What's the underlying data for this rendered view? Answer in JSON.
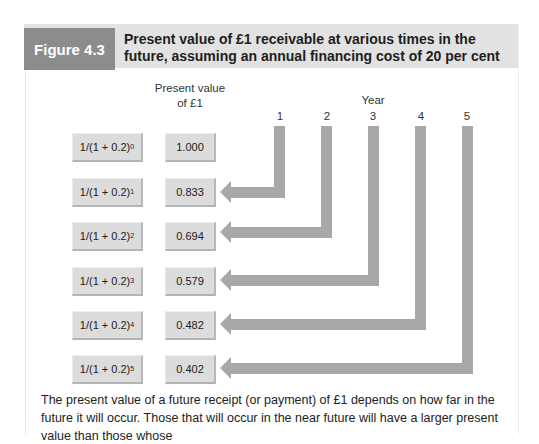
{
  "figure": {
    "label": "Figure 4.3",
    "title": "Present value of £1 receivable at various times in the future, assuming an annual financing cost of 20 per cent"
  },
  "headers": {
    "present_value": "Present value",
    "present_value_line2": "of £1",
    "year": "Year"
  },
  "years": [
    "1",
    "2",
    "3",
    "4",
    "5"
  ],
  "rows": [
    {
      "formula": "1/(1 + 0.2)",
      "exponent": "0",
      "value": "1.000"
    },
    {
      "formula": "1/(1 + 0.2)",
      "exponent": "1",
      "value": "0.833"
    },
    {
      "formula": "1/(1 + 0.2)",
      "exponent": "2",
      "value": "0.694"
    },
    {
      "formula": "1/(1 + 0.2)",
      "exponent": "3",
      "value": "0.579"
    },
    {
      "formula": "1/(1 + 0.2)",
      "exponent": "4",
      "value": "0.482"
    },
    {
      "formula": "1/(1 + 0.2)",
      "exponent": "5",
      "value": "0.402"
    }
  ],
  "caption": "The present value of a future receipt (or payment) of £1 depends on how far in the future it will occur. Those that will occur in the near future will have a larger present value than those whose",
  "colors": {
    "label_bg": "#8c8c8c",
    "header_bg": "#e2e2e2",
    "box_bg": "#dcdcdc",
    "arrow": "#a8a8a8"
  }
}
